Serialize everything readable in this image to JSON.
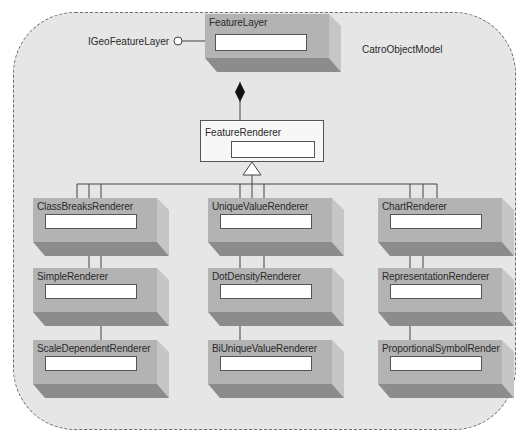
{
  "diagram": {
    "title": "CatroObjectModel",
    "interface_label": "IGeoFeatureLayer",
    "root": {
      "label": "FeatureLayer"
    },
    "abstract": {
      "label": "FeatureRenderer"
    },
    "columns": [
      {
        "items": [
          {
            "label": "ClassBreaksRenderer"
          },
          {
            "label": "SimpleRenderer"
          },
          {
            "label": "ScaleDependentRenderer"
          }
        ]
      },
      {
        "items": [
          {
            "label": "UniqueValueRenderer"
          },
          {
            "label": "DotDensityRenderer"
          },
          {
            "label": "BiUniqueValueRenderer"
          }
        ]
      },
      {
        "items": [
          {
            "label": "ChartRenderer"
          },
          {
            "label": "RepresentationRenderer"
          },
          {
            "label": "ProportionalSymbolRender"
          }
        ]
      }
    ],
    "relationships": {
      "root_to_abstract": "composition",
      "abstract_to_renderers": "generalization",
      "interface": "lollipop"
    },
    "colors": {
      "background": "#e6e6e6",
      "box_face": "#b3b3b3",
      "box_bottom": "#8c8c8c",
      "box_side": "#c6c6c6",
      "line": "#555555"
    }
  }
}
